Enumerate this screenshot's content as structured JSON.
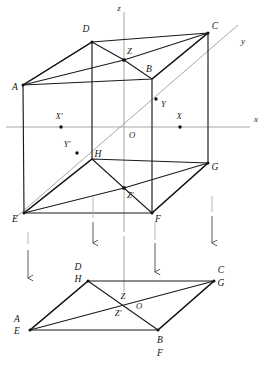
{
  "figure": {
    "colors": {
      "edge": "#1a1a1a",
      "axis": "#9a9a9a",
      "diagonal": "#8d8d8d",
      "guide": "#a8a8a8",
      "arrow": "#4a4a4a",
      "background": "#ffffff",
      "vertex_dot": "#111111"
    }
  },
  "axes": {
    "z_label": "z",
    "y_label": "y",
    "x_label": "x",
    "origin_label": "O"
  },
  "upper": {
    "name": "cube-diagram",
    "vertices": [
      {
        "id": "A",
        "label": "A",
        "x": 23,
        "y": 85,
        "lx": 15,
        "ly": 88
      },
      {
        "id": "B",
        "label": "B",
        "x": 152,
        "y": 79,
        "lx": 149,
        "ly": 70
      },
      {
        "id": "C",
        "label": "C",
        "x": 208,
        "y": 33,
        "lx": 214,
        "ly": 27
      },
      {
        "id": "D",
        "label": "D",
        "x": 92,
        "y": 42,
        "lx": 86,
        "ly": 30
      },
      {
        "id": "E",
        "label": "E",
        "x": 24,
        "y": 213,
        "lx": 15,
        "ly": 219
      },
      {
        "id": "F",
        "label": "F",
        "x": 152,
        "y": 213,
        "lx": 157,
        "ly": 219
      },
      {
        "id": "G",
        "label": "G",
        "x": 208,
        "y": 163,
        "lx": 214,
        "ly": 168
      },
      {
        "id": "H",
        "label": "H",
        "x": 92,
        "y": 159,
        "lx": 97,
        "ly": 155
      }
    ],
    "points": [
      {
        "id": "Z",
        "label": "Z",
        "x": 124,
        "y": 60,
        "lx": 126,
        "ly": 52,
        "dot": true
      },
      {
        "id": "Zp",
        "label": "Z'",
        "x": 124,
        "y": 188,
        "lx": 126,
        "ly": 195,
        "dot": true
      },
      {
        "id": "Y",
        "label": "Y",
        "x": 156,
        "y": 99,
        "lx": 160,
        "ly": 104,
        "dot": true
      },
      {
        "id": "Yp",
        "label": "Y'",
        "x": 77,
        "y": 153,
        "lx": 66,
        "ly": 146,
        "dot": true
      },
      {
        "id": "X",
        "label": "X",
        "x": 180,
        "y": 127,
        "lx": 178,
        "ly": 118,
        "dot": true
      },
      {
        "id": "Xp",
        "label": "X'",
        "x": 61,
        "y": 127,
        "lx": 58,
        "ly": 118,
        "dot": true
      }
    ]
  },
  "lower": {
    "name": "projection-diagram",
    "vertices": [
      {
        "id": "AE",
        "top": "A",
        "bottom": "E",
        "x": 30,
        "y": 330,
        "lx": 16,
        "ly": 320
      },
      {
        "id": "BF",
        "top": "B",
        "bottom": "F",
        "x": 158,
        "y": 330,
        "lx": 156,
        "ly": 340
      },
      {
        "id": "CG",
        "top": "C",
        "bottom": "G",
        "x": 214,
        "y": 281,
        "lx": 219,
        "ly": 271
      },
      {
        "id": "DH",
        "top": "D",
        "bottom": "H",
        "x": 88,
        "y": 281,
        "lx": 77,
        "ly": 271
      }
    ],
    "points": [
      {
        "id": "Z",
        "label": "Z",
        "x": 126,
        "y": 303,
        "lx": 122,
        "ly": 297
      },
      {
        "id": "Zp",
        "label": "Z'",
        "x": 124,
        "y": 312,
        "lx": 117,
        "ly": 314
      },
      {
        "id": "O",
        "label": "O",
        "x": 132,
        "y": 307,
        "lx": 136,
        "ly": 308
      }
    ]
  },
  "arrows": [
    {
      "name": "projection-arrow-1",
      "x": 28,
      "y1": 250,
      "y2": 278
    },
    {
      "name": "projection-arrow-2",
      "x": 93,
      "y1": 222,
      "y2": 243
    },
    {
      "name": "projection-arrow-3",
      "x": 155,
      "y1": 243,
      "y2": 272
    },
    {
      "name": "projection-arrow-4",
      "x": 212,
      "y1": 216,
      "y2": 243
    }
  ]
}
